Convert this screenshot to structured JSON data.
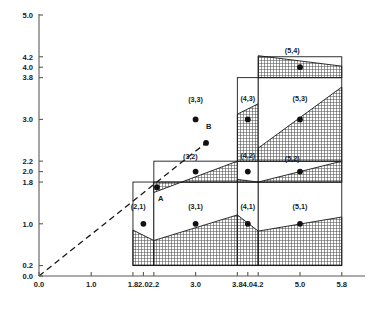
{
  "chart_data": {
    "type": "scatter",
    "title": "",
    "xlabel": "",
    "ylabel": "",
    "xlim": [
      0.0,
      5.9
    ],
    "ylim": [
      0.0,
      5.2
    ],
    "grid": false,
    "legend": null,
    "x_ticks": [
      "0.0",
      "1.0",
      "1.8",
      "2.0",
      "2.2",
      "3.0",
      "3.8",
      "4.0",
      "4.2",
      "5.0",
      "5.8"
    ],
    "x_tick_values": [
      0.0,
      1.0,
      1.8,
      2.0,
      2.2,
      3.0,
      3.8,
      4.0,
      4.2,
      5.0,
      5.8
    ],
    "y_ticks": [
      "0.0",
      "0.2",
      "1.0",
      "1.8",
      "2.0",
      "2.2",
      "3.0",
      "3.8",
      "4.0",
      "4.2",
      "5.0"
    ],
    "y_tick_values": [
      0.0,
      0.2,
      1.0,
      1.8,
      2.0,
      2.2,
      3.0,
      3.8,
      4.0,
      4.2,
      5.0
    ],
    "points": [
      {
        "label": "(2,1)",
        "x": 2.0,
        "y": 1.0,
        "label_x": 1.9,
        "label_y": 1.28
      },
      {
        "label": "(3,1)",
        "x": 3.0,
        "y": 1.0,
        "label_x": 3.0,
        "label_y": 1.28
      },
      {
        "label": "(4,1)",
        "x": 4.0,
        "y": 1.0,
        "label_x": 4.0,
        "label_y": 1.28
      },
      {
        "label": "(5,1)",
        "x": 5.0,
        "y": 1.0,
        "label_x": 5.0,
        "label_y": 1.28
      },
      {
        "label": "(3,2)",
        "x": 3.0,
        "y": 2.0,
        "label_x": 2.9,
        "label_y": 2.24
      },
      {
        "label": "(4,2)",
        "x": 4.0,
        "y": 2.0,
        "label_x": 4.0,
        "label_y": 2.26
      },
      {
        "label": "(5,2)",
        "x": 5.0,
        "y": 2.0,
        "label_x": 4.85,
        "label_y": 2.21
      },
      {
        "label": "(3,3)",
        "x": 3.0,
        "y": 3.0,
        "label_x": 3.0,
        "label_y": 3.33
      },
      {
        "label": "(4,3)",
        "x": 4.0,
        "y": 3.0,
        "label_x": 4.0,
        "label_y": 3.35
      },
      {
        "label": "(5,3)",
        "x": 5.0,
        "y": 3.0,
        "label_x": 5.0,
        "label_y": 3.35
      },
      {
        "label": "(5,4)",
        "x": 5.0,
        "y": 4.0,
        "label_x": 4.85,
        "label_y": 4.27
      }
    ],
    "annotated_points": [
      {
        "label": "A",
        "x": 2.26,
        "y": 1.7,
        "label_x": 2.33,
        "label_y": 1.44
      },
      {
        "label": "B",
        "x": 3.2,
        "y": 2.55,
        "label_x": 3.25,
        "label_y": 2.82
      }
    ],
    "diagonal_line": {
      "style": "dashed",
      "from": [
        0.0,
        0.0
      ],
      "to": [
        3.2,
        2.55
      ]
    },
    "cells": [
      {
        "label": "(2,1)",
        "x0": 1.8,
        "x1": 2.2,
        "y_top": 1.8,
        "y_bottom": 0.2,
        "fill_left": 0.88,
        "fill_right": 0.68
      },
      {
        "label": "(3,1)",
        "x0": 2.2,
        "x1": 3.8,
        "y_top": 1.8,
        "y_bottom": 0.2,
        "fill_left": 0.68,
        "fill_right": 1.17
      },
      {
        "label": "(4,1)",
        "x0": 3.8,
        "x1": 4.2,
        "y_top": 1.8,
        "y_bottom": 0.2,
        "fill_left": 1.17,
        "fill_right": 0.86
      },
      {
        "label": "(5,1)",
        "x0": 4.2,
        "x1": 5.8,
        "y_top": 1.8,
        "y_bottom": 0.2,
        "fill_left": 0.86,
        "fill_right": 1.13
      },
      {
        "label": "(3,2)",
        "x0": 2.2,
        "x1": 3.8,
        "y_top": 2.2,
        "y_bottom": 1.8,
        "fill_left": 1.6,
        "fill_right": 2.2
      },
      {
        "label": "(4,2)",
        "x0": 3.8,
        "x1": 4.2,
        "y_top": 2.2,
        "y_bottom": 1.8,
        "fill_left": 1.85,
        "fill_right": 1.8
      },
      {
        "label": "(5,2)",
        "x0": 4.2,
        "x1": 5.8,
        "y_top": 2.2,
        "y_bottom": 1.8,
        "fill_left": 1.8,
        "fill_right": 2.2
      },
      {
        "label": "(4,3)",
        "x0": 3.8,
        "x1": 4.2,
        "y_top": 3.8,
        "y_bottom": 2.2,
        "fill_left": 3.1,
        "fill_right": 3.3
      },
      {
        "label": "(5,3)",
        "x0": 4.2,
        "x1": 5.8,
        "y_top": 3.8,
        "y_bottom": 2.2,
        "fill_left": 2.45,
        "fill_right": 3.62
      },
      {
        "label": "(5,4)",
        "x0": 4.2,
        "x1": 5.8,
        "y_top": 4.2,
        "y_bottom": 3.8,
        "fill_left": 4.22,
        "fill_right": 4.02
      }
    ],
    "colors": {
      "axis": "#5a5a5a",
      "line": "#1a1a1a",
      "point": "#111111",
      "hatch": "#4a4a4a",
      "text": "#1a1a1a"
    }
  }
}
